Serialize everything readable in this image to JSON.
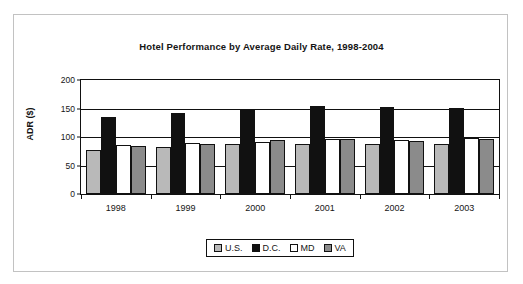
{
  "chart_data": {
    "type": "bar",
    "title": "Hotel Performance by Average Daily Rate, 1998-2004",
    "xlabel": "",
    "ylabel": "ADR ($)",
    "ylim": [
      0,
      200
    ],
    "yticks": [
      0,
      50,
      100,
      150,
      200
    ],
    "grid": true,
    "legend_position": "bottom",
    "categories": [
      "1998",
      "1999",
      "2000",
      "2001",
      "2002",
      "2003"
    ],
    "series": [
      {
        "name": "U.S.",
        "color": "#b9b9b9",
        "values": [
          77,
          82,
          87,
          88,
          87,
          88
        ]
      },
      {
        "name": "D.C.",
        "color": "#111111",
        "values": [
          135,
          142,
          150,
          155,
          153,
          151
        ]
      },
      {
        "name": "MD",
        "color": "#ffffff",
        "values": [
          86,
          89,
          92,
          97,
          95,
          98
        ]
      },
      {
        "name": "VA",
        "color": "#8b8b8b",
        "values": [
          84,
          87,
          94,
          97,
          93,
          96
        ]
      }
    ]
  },
  "legend": {
    "items": [
      {
        "label": "U.S."
      },
      {
        "label": "D.C."
      },
      {
        "label": "MD"
      },
      {
        "label": "VA"
      }
    ]
  }
}
